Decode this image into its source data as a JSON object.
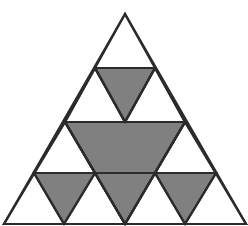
{
  "figure": {
    "kind": "geometric-fractal-diagram",
    "canvas": {
      "width": 248,
      "height": 226
    },
    "background_color": "#ffffff",
    "stroke_color": "#2b2b2b",
    "stroke_width": 2.2,
    "fill_color": "#808080",
    "empty_fill_color": "#ffffff",
    "cropped_at_bottom": true,
    "outer_triangle": {
      "name": "outer-triangle",
      "apex": {
        "x": 125,
        "y": 14
      },
      "bottom_left": {
        "x": 4,
        "y": 224
      },
      "bottom_right": {
        "x": 246,
        "y": 224
      },
      "filled": false
    },
    "inverted_triangles": [
      {
        "name": "center-large-inverted-triangle",
        "level": 1,
        "filled": true,
        "points": [
          {
            "x": 65,
            "y": 122
          },
          {
            "x": 185,
            "y": 122
          },
          {
            "x": 125,
            "y": 224
          }
        ]
      },
      {
        "name": "top-inverted-triangle",
        "level": 2,
        "filled": true,
        "points": [
          {
            "x": 95,
            "y": 68
          },
          {
            "x": 155,
            "y": 68
          },
          {
            "x": 125,
            "y": 122
          }
        ]
      },
      {
        "name": "bottom-left-inverted-triangle",
        "level": 2,
        "filled": true,
        "points": [
          {
            "x": 34,
            "y": 173
          },
          {
            "x": 95,
            "y": 173
          },
          {
            "x": 64,
            "y": 224
          }
        ]
      },
      {
        "name": "bottom-center-inverted-triangle",
        "level": 2,
        "filled": true,
        "points": [
          {
            "x": 95,
            "y": 173
          },
          {
            "x": 155,
            "y": 173
          },
          {
            "x": 125,
            "y": 224
          }
        ]
      },
      {
        "name": "bottom-right-inverted-triangle",
        "level": 2,
        "filled": true,
        "points": [
          {
            "x": 155,
            "y": 173
          },
          {
            "x": 216,
            "y": 173
          },
          {
            "x": 185,
            "y": 224
          }
        ]
      }
    ],
    "upright_triangles": [
      {
        "name": "top-upright-triangle",
        "level": 1,
        "filled": false,
        "points": [
          {
            "x": 125,
            "y": 14
          },
          {
            "x": 65,
            "y": 122
          },
          {
            "x": 185,
            "y": 122
          }
        ]
      },
      {
        "name": "bottom-left-upright-triangle",
        "level": 1,
        "filled": false,
        "points": [
          {
            "x": 65,
            "y": 122
          },
          {
            "x": 4,
            "y": 224
          },
          {
            "x": 125,
            "y": 224
          }
        ]
      },
      {
        "name": "bottom-right-upright-triangle",
        "level": 1,
        "filled": false,
        "points": [
          {
            "x": 185,
            "y": 122
          },
          {
            "x": 125,
            "y": 224
          },
          {
            "x": 246,
            "y": 224
          }
        ]
      },
      {
        "name": "upper-left-small-upright-triangle",
        "level": 2,
        "filled": false,
        "points": [
          {
            "x": 95,
            "y": 68
          },
          {
            "x": 65,
            "y": 122
          },
          {
            "x": 125,
            "y": 122
          }
        ]
      },
      {
        "name": "upper-right-small-upright-triangle",
        "level": 2,
        "filled": false,
        "points": [
          {
            "x": 155,
            "y": 68
          },
          {
            "x": 125,
            "y": 122
          },
          {
            "x": 185,
            "y": 122
          }
        ]
      },
      {
        "name": "mid-left-small-upright-triangle",
        "level": 2,
        "filled": false,
        "points": [
          {
            "x": 65,
            "y": 122
          },
          {
            "x": 34,
            "y": 173
          },
          {
            "x": 95,
            "y": 173
          }
        ]
      },
      {
        "name": "mid-right-small-upright-triangle",
        "level": 2,
        "filled": false,
        "points": [
          {
            "x": 185,
            "y": 122
          },
          {
            "x": 155,
            "y": 173
          },
          {
            "x": 216,
            "y": 173
          }
        ]
      }
    ],
    "construction_lines": [
      {
        "name": "level1-horizontal-midline",
        "from": {
          "x": 65,
          "y": 122
        },
        "to": {
          "x": 185,
          "y": 122
        }
      },
      {
        "name": "level2-upper-horizontal-line",
        "from": {
          "x": 95,
          "y": 68
        },
        "to": {
          "x": 155,
          "y": 68
        }
      },
      {
        "name": "level2-lower-horizontal-line-left",
        "from": {
          "x": 34,
          "y": 173
        },
        "to": {
          "x": 95,
          "y": 173
        }
      },
      {
        "name": "level2-lower-horizontal-line-right",
        "from": {
          "x": 155,
          "y": 173
        },
        "to": {
          "x": 216,
          "y": 173
        }
      },
      {
        "name": "level1-left-diagonal",
        "from": {
          "x": 65,
          "y": 122
        },
        "to": {
          "x": 125,
          "y": 224
        }
      },
      {
        "name": "level1-right-diagonal",
        "from": {
          "x": 185,
          "y": 122
        },
        "to": {
          "x": 125,
          "y": 224
        }
      },
      {
        "name": "level2-top-left-diagonal",
        "from": {
          "x": 95,
          "y": 68
        },
        "to": {
          "x": 125,
          "y": 122
        }
      },
      {
        "name": "level2-top-right-diagonal",
        "from": {
          "x": 155,
          "y": 68
        },
        "to": {
          "x": 125,
          "y": 122
        }
      },
      {
        "name": "level2-bottom-left-diagonal-a",
        "from": {
          "x": 34,
          "y": 173
        },
        "to": {
          "x": 64,
          "y": 224
        }
      },
      {
        "name": "level2-bottom-left-diagonal-b",
        "from": {
          "x": 95,
          "y": 173
        },
        "to": {
          "x": 64,
          "y": 224
        }
      },
      {
        "name": "level2-bottom-right-diagonal-a",
        "from": {
          "x": 155,
          "y": 173
        },
        "to": {
          "x": 185,
          "y": 224
        }
      },
      {
        "name": "level2-bottom-right-diagonal-b",
        "from": {
          "x": 216,
          "y": 173
        },
        "to": {
          "x": 185,
          "y": 224
        }
      }
    ]
  }
}
